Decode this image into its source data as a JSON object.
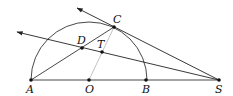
{
  "diagram": {
    "type": "geometry",
    "points": {
      "A": {
        "label": "A",
        "x": 31,
        "y": 80
      },
      "O": {
        "label": "O",
        "x": 89,
        "y": 80
      },
      "B": {
        "label": "B",
        "x": 146,
        "y": 80
      },
      "S": {
        "label": "S",
        "x": 219,
        "y": 80
      },
      "C": {
        "label": "C",
        "x": 114,
        "y": 27
      },
      "D": {
        "label": "D",
        "x": 82,
        "y": 48
      },
      "T": {
        "label": "T",
        "x": 102,
        "y": 52
      }
    },
    "segments": [
      {
        "from": "A",
        "to": "S",
        "style": "solid"
      },
      {
        "from": "A",
        "to": "C",
        "style": "solid"
      },
      {
        "from": "O",
        "to": "C",
        "style": "light"
      },
      {
        "from": "C",
        "to": "S",
        "style": "solid"
      }
    ],
    "rays": [
      {
        "from": "S",
        "through": "C",
        "arrow_end": {
          "x": 76,
          "y": 8
        }
      },
      {
        "from": "S",
        "through": "T",
        "arrow_end": {
          "x": 17,
          "y": 32
        }
      }
    ],
    "arc": {
      "center": "O",
      "radius": 58,
      "from": "A",
      "to": "B",
      "side": "upper"
    },
    "colors": {
      "line": "#222222",
      "light_line": "#bbbbbb",
      "point": "#111111"
    }
  }
}
